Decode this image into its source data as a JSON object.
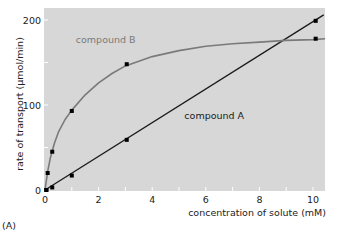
{
  "figure_label": "(A)",
  "chart_data": {
    "type": "line",
    "title": "",
    "xlabel": "concentration of solute (mM)",
    "ylabel": "rate of transport (µmol/min)",
    "xlim": [
      0,
      10.5
    ],
    "ylim": [
      0,
      210
    ],
    "x_ticks": [
      0,
      2,
      4,
      6,
      8,
      10
    ],
    "x_minor_ticks": [
      1,
      3,
      5,
      7,
      9
    ],
    "y_ticks": [
      0,
      100,
      200
    ],
    "y_minor_ticks": [
      50,
      150
    ],
    "grid": false,
    "legend": "inline labels",
    "background": "#d7d7d7",
    "series": [
      {
        "name": "compound A",
        "label_pos": [
          5.2,
          84
        ],
        "color": "#1a1a1a",
        "fit": "linear",
        "points": [
          [
            0.05,
            0
          ],
          [
            0.27,
            3
          ],
          [
            1.0,
            17
          ],
          [
            3.05,
            59
          ],
          [
            10.1,
            199
          ]
        ],
        "curve": [
          [
            0,
            0
          ],
          [
            10.4,
            206
          ]
        ]
      },
      {
        "name": "compound B",
        "label_pos": [
          1.15,
          173
        ],
        "color": "#7a7a7a",
        "fit": "hyperbolic (saturating)",
        "points": [
          [
            0.05,
            0
          ],
          [
            0.1,
            20
          ],
          [
            0.27,
            45
          ],
          [
            1.0,
            93
          ],
          [
            3.05,
            148
          ],
          [
            10.1,
            178
          ]
        ],
        "curve": [
          [
            0,
            0
          ],
          [
            0.1,
            22
          ],
          [
            0.2,
            38
          ],
          [
            0.35,
            55
          ],
          [
            0.5,
            68
          ],
          [
            0.75,
            83
          ],
          [
            1.0,
            94
          ],
          [
            1.5,
            112
          ],
          [
            2.0,
            126
          ],
          [
            2.5,
            137
          ],
          [
            3.0,
            146
          ],
          [
            4.0,
            157
          ],
          [
            5.0,
            164
          ],
          [
            6.0,
            169
          ],
          [
            7.0,
            172
          ],
          [
            8.0,
            174
          ],
          [
            9.0,
            176
          ],
          [
            10.0,
            177
          ],
          [
            10.45,
            178
          ]
        ]
      }
    ]
  }
}
